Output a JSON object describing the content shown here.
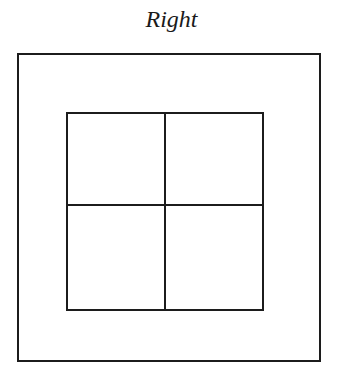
{
  "diagram": {
    "title": "Right",
    "shapes": {
      "outer_square": "outer-square",
      "inner_square": "inner-square",
      "divider": "cross-divider"
    },
    "grid": {
      "rows": 2,
      "columns": 2
    },
    "line_color": "#1c1c1c"
  }
}
